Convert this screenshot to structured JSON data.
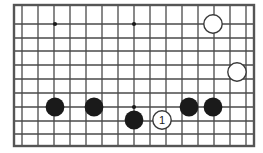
{
  "figure": {
    "kind": "go-board-diagram",
    "width": 263,
    "height": 153,
    "background_color": "#ffffff"
  },
  "board": {
    "border_color": "#555555",
    "line_color": "#4a4a4a",
    "border_width": 2.4,
    "line_width": 1.3,
    "left": 14,
    "top": 5,
    "right": 254,
    "bottom": 146,
    "col_count": 16,
    "row_count": 11,
    "col_spacing": 16,
    "row_spacing": 14.1,
    "columns_x": [
      14,
      30,
      46,
      62,
      78,
      94,
      110,
      126,
      142,
      158,
      174,
      190,
      206,
      222,
      238,
      254
    ],
    "rows_y": [
      5,
      19.1,
      33.2,
      47.3,
      61.4,
      75.5,
      89.6,
      103.7,
      117.8,
      131.9,
      146
    ],
    "star_points": [
      {
        "name": "star-point-left",
        "x": 55,
        "y": 24,
        "radius": 2.1
      },
      {
        "name": "star-point-center",
        "x": 134,
        "y": 24,
        "radius": 2.1
      },
      {
        "name": "star-point-lower-center",
        "x": 134,
        "y": 107,
        "radius": 2.1
      }
    ],
    "grid_vertical_x": [
      22,
      38,
      54,
      70,
      86,
      102,
      118,
      134,
      150,
      166,
      182,
      198,
      214,
      230,
      246
    ],
    "grid_horizontal_y": [
      24,
      38,
      51,
      65,
      79,
      93,
      107,
      121,
      134
    ]
  },
  "stones": {
    "black_color": "#1a1a1a",
    "white_color": "#ffffff",
    "white_outline_color": "#3a3a3a",
    "radius": 9.2,
    "black_radius": 9.4,
    "white_outline_width": 1.4,
    "items": [
      {
        "id": "black-stone-1",
        "color": "black",
        "x": 55,
        "y": 107,
        "label": ""
      },
      {
        "id": "black-stone-2",
        "color": "black",
        "x": 94,
        "y": 107,
        "label": ""
      },
      {
        "id": "black-stone-3",
        "color": "black",
        "x": 134,
        "y": 120,
        "label": ""
      },
      {
        "id": "black-stone-4",
        "color": "black",
        "x": 189,
        "y": 107,
        "label": ""
      },
      {
        "id": "black-stone-5",
        "color": "black",
        "x": 213,
        "y": 107,
        "label": ""
      },
      {
        "id": "white-stone-1",
        "color": "white",
        "x": 213,
        "y": 24,
        "label": ""
      },
      {
        "id": "white-stone-2",
        "color": "white",
        "x": 237,
        "y": 72,
        "label": ""
      },
      {
        "id": "white-stone-move-1",
        "color": "white",
        "x": 162,
        "y": 120,
        "label": "1"
      }
    ]
  },
  "move_labels": {
    "label_color": "#1a1a1a",
    "font_size": 11,
    "move_one": "1"
  }
}
